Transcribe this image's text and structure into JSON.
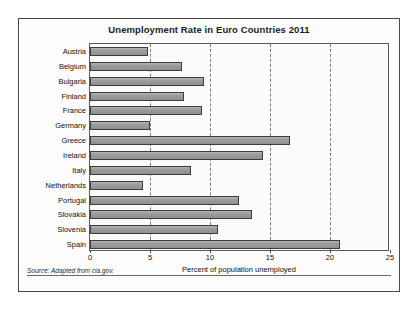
{
  "chart_data": {
    "type": "bar",
    "orientation": "horizontal",
    "title": "Unemployment Rate in Euro Countries 2011",
    "xlabel": "Percent of population unemployed",
    "ylabel": "",
    "xlim": [
      0,
      25
    ],
    "xticks": [
      0,
      5,
      10,
      15,
      20,
      25
    ],
    "grid": true,
    "legend": null,
    "categories": [
      "Austria",
      "Belgium",
      "Bulgaria",
      "Finland",
      "France",
      "Germany",
      "Greece",
      "Ireland",
      "Italy",
      "Netherlands",
      "Portugal",
      "Slovakia",
      "Slovenia",
      "Spain"
    ],
    "values": [
      4.8,
      7.7,
      9.5,
      7.8,
      9.3,
      5.0,
      16.7,
      14.4,
      8.4,
      4.4,
      12.4,
      13.5,
      10.7,
      20.8
    ],
    "bar_color": "#9d9d9d",
    "bar_edge_color": "#3d3d3d",
    "source": "Source: Adapted from cia.gov."
  }
}
